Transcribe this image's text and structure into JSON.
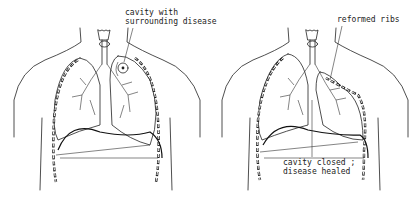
{
  "figure": {
    "panels": [
      {
        "id": "before",
        "labels": [
          {
            "text": "cavity with\nsurrounding disease"
          }
        ]
      },
      {
        "id": "after",
        "labels": [
          {
            "text": "reformed ribs"
          },
          {
            "text": "cavity closed ;\ndisease healed"
          }
        ]
      }
    ]
  }
}
